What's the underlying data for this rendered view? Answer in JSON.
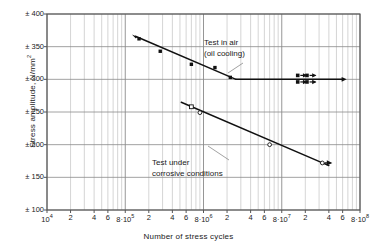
{
  "chart_data": {
    "type": "line",
    "title": "",
    "xlabel": "Number of stress cycles",
    "ylabel": "Stress amplitude, N/mm²",
    "xscale": "log",
    "xlim": [
      10000,
      100000000
    ],
    "ylim": [
      100,
      400
    ],
    "grid": true,
    "yticks": [
      "± 400",
      "± 350",
      "± 300",
      "± 250",
      "± 200",
      "± 150",
      "± 100"
    ],
    "ytick_values": [
      400,
      350,
      300,
      250,
      200,
      150,
      100
    ],
    "xticks": [
      {
        "label": "10",
        "exp": "4",
        "value": 10000
      },
      {
        "label": "2",
        "exp": "",
        "value": 20000
      },
      {
        "label": "4",
        "exp": "",
        "value": 40000
      },
      {
        "label": "6",
        "exp": "",
        "value": 60000
      },
      {
        "label": "8·10",
        "exp": "5",
        "value": 100000
      },
      {
        "label": "2",
        "exp": "",
        "value": 200000
      },
      {
        "label": "4",
        "exp": "",
        "value": 400000
      },
      {
        "label": "6",
        "exp": "",
        "value": 600000
      },
      {
        "label": "8·10",
        "exp": "6",
        "value": 1000000
      },
      {
        "label": "2",
        "exp": "",
        "value": 2000000
      },
      {
        "label": "4",
        "exp": "",
        "value": 4000000
      },
      {
        "label": "6",
        "exp": "",
        "value": 6000000
      },
      {
        "label": "8·10",
        "exp": "7",
        "value": 10000000
      },
      {
        "label": "2",
        "exp": "",
        "value": 20000000
      },
      {
        "label": "4",
        "exp": "",
        "value": 40000000
      },
      {
        "label": "6",
        "exp": "",
        "value": 60000000
      },
      {
        "label": "8·10",
        "exp": "8",
        "value": 100000000
      }
    ],
    "series": [
      {
        "name": "Test in air (oil cooling)",
        "marker": "filled-square",
        "color": "#111111",
        "points": [
          {
            "x": 150000,
            "y": 362
          },
          {
            "x": 280000,
            "y": 343
          },
          {
            "x": 700000,
            "y": 323
          },
          {
            "x": 1400000,
            "y": 318
          },
          {
            "x": 2200000,
            "y": 303
          }
        ],
        "fit_line": [
          {
            "x": 135000,
            "y": 366
          },
          {
            "x": 2600000,
            "y": 300
          }
        ],
        "plateau": [
          {
            "x": 2600000,
            "y": 300
          },
          {
            "x": 60000000,
            "y": 300
          }
        ],
        "runouts": [
          {
            "x": 16000000,
            "y": 306
          },
          {
            "x": 16000000,
            "y": 296
          },
          {
            "x": 21000000,
            "y": 306
          },
          {
            "x": 21000000,
            "y": 296
          }
        ]
      },
      {
        "name": "Test under corrosive conditions",
        "marker": "open-square-circle",
        "color": "#111111",
        "points": [
          {
            "x": 700000,
            "y": 258
          },
          {
            "x": 900000,
            "y": 249
          },
          {
            "x": 7000000,
            "y": 200
          },
          {
            "x": 33000000,
            "y": 172
          }
        ],
        "fit_line": [
          {
            "x": 520000,
            "y": 265
          },
          {
            "x": 40000000,
            "y": 168
          }
        ],
        "runouts": [
          {
            "x": 33000000,
            "y": 172
          }
        ]
      }
    ],
    "annotations": [
      {
        "id": "air",
        "line1": "Test in air",
        "line2": "(oil cooling)"
      },
      {
        "id": "corrosive",
        "line1": "Test under",
        "line2": "corrosive conditions"
      }
    ],
    "colors": {
      "grid_major": "#8a8a8a",
      "grid_minor": "#b8b8b8",
      "axis": "#555555",
      "data": "#111111",
      "leader": "#8a8a8a"
    }
  }
}
